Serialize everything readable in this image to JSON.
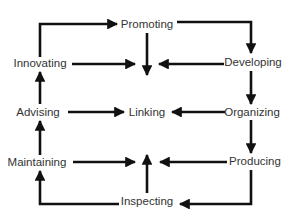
{
  "diagram": {
    "title": "",
    "line_color": "#111111",
    "text_color": "#333333",
    "nodes": [
      {
        "id": "promoting",
        "label": "Promoting",
        "x": 147,
        "y": 25
      },
      {
        "id": "innovating",
        "label": "Innovating",
        "x": 40,
        "y": 64
      },
      {
        "id": "developing",
        "label": "Developing",
        "x": 253,
        "y": 63
      },
      {
        "id": "advising",
        "label": "Advising",
        "x": 38,
        "y": 113
      },
      {
        "id": "linking",
        "label": "Linking",
        "x": 147,
        "y": 113
      },
      {
        "id": "organizing",
        "label": "Organizing",
        "x": 252,
        "y": 113
      },
      {
        "id": "maintaining",
        "label": "Maintaining",
        "x": 37,
        "y": 163
      },
      {
        "id": "producing",
        "label": "Producing",
        "x": 255,
        "y": 162
      },
      {
        "id": "inspecting",
        "label": "Inspecting",
        "x": 147,
        "y": 202
      }
    ],
    "edges": [
      {
        "from": "innovating",
        "to": "promoting",
        "type": "elbow"
      },
      {
        "from": "promoting",
        "to": "developing",
        "type": "elbow"
      },
      {
        "from": "promoting",
        "to": "center-top",
        "type": "straight"
      },
      {
        "from": "innovating",
        "to": "center-top",
        "type": "straight"
      },
      {
        "from": "developing",
        "to": "center-top",
        "type": "straight"
      },
      {
        "from": "developing",
        "to": "organizing",
        "type": "straight"
      },
      {
        "from": "advising",
        "to": "linking",
        "type": "straight"
      },
      {
        "from": "organizing",
        "to": "linking",
        "type": "straight"
      },
      {
        "from": "advising",
        "to": "innovating",
        "type": "straight"
      },
      {
        "from": "organizing",
        "to": "producing",
        "type": "straight"
      },
      {
        "from": "maintaining",
        "to": "advising",
        "type": "straight"
      },
      {
        "from": "maintaining",
        "to": "center-bottom",
        "type": "straight"
      },
      {
        "from": "producing",
        "to": "center-bottom",
        "type": "straight"
      },
      {
        "from": "inspecting",
        "to": "center-bottom",
        "type": "straight"
      },
      {
        "from": "producing",
        "to": "inspecting",
        "type": "elbow"
      },
      {
        "from": "inspecting",
        "to": "maintaining",
        "type": "elbow"
      }
    ]
  }
}
